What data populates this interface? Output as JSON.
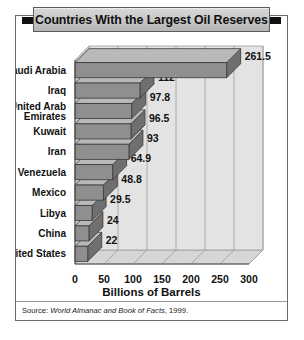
{
  "title": "Countries With the Largest Oil Reserves",
  "axis_title": "Billions of Barrels",
  "source": {
    "prefix": "Source: ",
    "italic": "World Almanac and Book of Facts",
    "suffix": ", 1999."
  },
  "chart_data": {
    "type": "bar",
    "orientation": "horizontal",
    "title": "Countries With the Largest Oil Reserves",
    "xlabel": "Billions of Barrels",
    "ylabel": "",
    "xlim": [
      0,
      300
    ],
    "xticks": [
      0,
      50,
      100,
      150,
      200,
      250,
      300
    ],
    "xtick_labels": [
      "0",
      "50",
      "100",
      "150",
      "200",
      "250",
      "300"
    ],
    "grid": true,
    "legend": false,
    "categories": [
      "Saudi Arabia",
      "United Arab Emirates",
      "Iraq",
      "Kuwait",
      "Iran",
      "Venezuela",
      "Mexico",
      "Libya",
      "China",
      "United States"
    ],
    "bars": [
      {
        "label": "Saudi Arabia",
        "label_lines": [
          "Saudi Arabia"
        ],
        "value": 261.5,
        "value_label": "261.5"
      },
      {
        "label": "Iraq",
        "label_lines": [
          "Iraq"
        ],
        "value": 112,
        "value_label": "112"
      },
      {
        "label": "United Arab Emirates",
        "label_lines": [
          "United Arab",
          "Emirates"
        ],
        "value": 97.8,
        "value_label": "97.8"
      },
      {
        "label": "Kuwait",
        "label_lines": [
          "Kuwait"
        ],
        "value": 96.5,
        "value_label": "96.5"
      },
      {
        "label": "Iran",
        "label_lines": [
          "Iran"
        ],
        "value": 93,
        "value_label": "93"
      },
      {
        "label": "Venezuela",
        "label_lines": [
          "Venezuela"
        ],
        "value": 64.9,
        "value_label": "64.9"
      },
      {
        "label": "Mexico",
        "label_lines": [
          "Mexico"
        ],
        "value": 48.8,
        "value_label": "48.8"
      },
      {
        "label": "Libya",
        "label_lines": [
          "Libya"
        ],
        "value": 29.5,
        "value_label": "29.5"
      },
      {
        "label": "China",
        "label_lines": [
          "China"
        ],
        "value": 24,
        "value_label": "24"
      },
      {
        "label": "United States",
        "label_lines": [
          "United States"
        ],
        "value": 22,
        "value_label": "22"
      }
    ],
    "values": [
      261.5,
      112,
      97.8,
      96.5,
      93,
      64.9,
      48.8,
      29.5,
      24,
      22
    ],
    "colors": {
      "bar_front": "#8f8f8f",
      "bar_top": "#b9b9b9",
      "bar_side": "#6f6f6f",
      "bar_outline": "#3a3a3a",
      "plot_floor": "#d6d6d6",
      "plot_back": "#e3e3e3",
      "gridline": "#9c9c9c",
      "text": "#111111",
      "frame": "#6b6b6b",
      "title_plaque": "#c9c9c9",
      "title_tab": "#111111"
    }
  }
}
